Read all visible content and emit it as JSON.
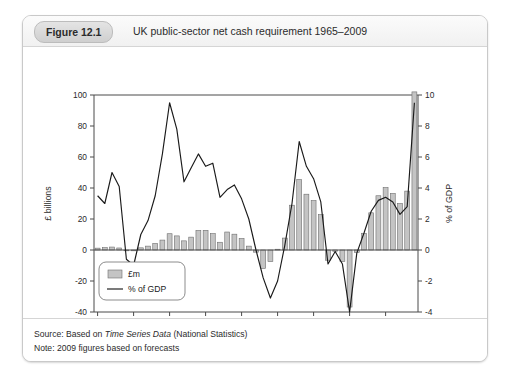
{
  "figure": {
    "badge": "Figure 12.1",
    "title": "UK public-sector net cash requirement 1965–2009",
    "source_prefix": "Source: Based on ",
    "source_italic": "Time Series Data",
    "source_suffix": " (National Statistics)",
    "note": "Note: 2009 figures based on forecasts"
  },
  "chart_data": {
    "type": "bar",
    "title": "UK public-sector net cash requirement 1965–2009",
    "xlabel": "",
    "ylabel": "£ billions",
    "y2label": "% of GDP",
    "ylim": [
      -40,
      100
    ],
    "y2lim": [
      -4,
      10
    ],
    "yticks": [
      -40,
      -20,
      0,
      20,
      40,
      60,
      80,
      100
    ],
    "y2ticks": [
      -4,
      -2,
      0,
      2,
      4,
      6,
      8,
      10
    ],
    "xticks": [
      1965,
      1970,
      1975,
      1980,
      1985,
      1990,
      1995,
      2000,
      2005
    ],
    "xlim": [
      1964.5,
      2009.5
    ],
    "grid": false,
    "legend_position": "bottom-left",
    "legend": [
      {
        "label": "£m",
        "marker": "bar",
        "color": "#c4c4c4"
      },
      {
        "label": "% of GDP",
        "marker": "line",
        "color": "#1a1a1a"
      }
    ],
    "categories": [
      1965,
      1966,
      1967,
      1968,
      1969,
      1970,
      1971,
      1972,
      1973,
      1974,
      1975,
      1976,
      1977,
      1978,
      1979,
      1980,
      1981,
      1982,
      1983,
      1984,
      1985,
      1986,
      1987,
      1988,
      1989,
      1990,
      1991,
      1992,
      1993,
      1994,
      1995,
      1996,
      1997,
      1998,
      1999,
      2000,
      2001,
      2002,
      2003,
      2004,
      2005,
      2006,
      2007,
      2008,
      2009
    ],
    "series": [
      {
        "name": "£m",
        "axis": "left",
        "unit": "£ billions",
        "values": [
          1.2,
          1.5,
          1.9,
          1.3,
          -0.5,
          -0.2,
          1.4,
          2.5,
          4.2,
          6.4,
          10.5,
          9.1,
          5.9,
          8.3,
          12.6,
          12.7,
          10.6,
          5.0,
          11.6,
          10.2,
          7.4,
          2.5,
          -1.4,
          -11.9,
          -7.5,
          0.5,
          7.7,
          28.9,
          45.4,
          36.0,
          31.9,
          22.8,
          -6.6,
          -0.8,
          -7.4,
          -36.8,
          -1.5,
          10.8,
          24.0,
          35.0,
          40.3,
          36.5,
          30.0,
          38.0,
          102.0
        ]
      },
      {
        "name": "% of GDP",
        "axis": "right",
        "unit": "%",
        "values": [
          3.5,
          3.0,
          5.0,
          4.1,
          -0.6,
          -1.0,
          1.0,
          1.9,
          3.5,
          6.2,
          9.5,
          7.8,
          4.4,
          5.3,
          6.2,
          5.4,
          5.6,
          3.4,
          3.9,
          4.2,
          3.3,
          2.0,
          0.0,
          -1.8,
          -3.1,
          -2.0,
          0.3,
          3.0,
          7.0,
          5.4,
          4.6,
          3.1,
          -0.9,
          -0.1,
          -0.9,
          -4.0,
          -0.2,
          1.1,
          2.5,
          3.2,
          3.4,
          3.1,
          2.3,
          2.8,
          9.5
        ]
      }
    ]
  }
}
